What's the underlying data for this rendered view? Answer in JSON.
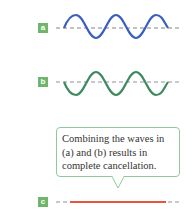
{
  "panels": [
    {
      "label": "a",
      "wave_color": "#3b5fc0",
      "phase": "normal"
    },
    {
      "label": "b",
      "wave_color": "#3e8a5e",
      "phase": "inverted"
    },
    {
      "label": "c",
      "line_color": "#e8553a",
      "phase": "cancelled"
    }
  ],
  "callout": {
    "lines": [
      "Combining the waves in",
      "(a) and (b) results in",
      "complete cancellation."
    ],
    "border_color": "#8fc99a"
  },
  "colors": {
    "label_bg": "#6fb56a",
    "axis_dash": "#666666"
  }
}
